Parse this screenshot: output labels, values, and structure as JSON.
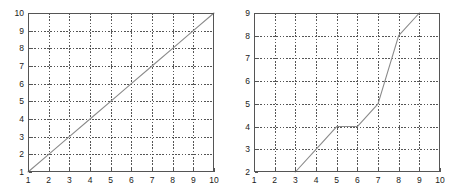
{
  "figure": {
    "background_color": "#ffffff",
    "axes_color": "#555555",
    "grid_color": "#555555",
    "line_color": "#8a8a8a",
    "tick_label_color": "#1a1a1a",
    "panel_count": 2
  },
  "chart_data": [
    {
      "type": "line",
      "title": "",
      "xlabel": "",
      "ylabel": "",
      "xlim": [
        1,
        10
      ],
      "ylim": [
        1,
        10
      ],
      "grid": true,
      "grid_style": "dashed",
      "legend": null,
      "xticks": [
        1,
        2,
        3,
        4,
        5,
        6,
        7,
        8,
        9,
        10
      ],
      "yticks": [
        1,
        2,
        3,
        4,
        5,
        6,
        7,
        8,
        9,
        10
      ],
      "xticklabels": [
        "1",
        "2",
        "3",
        "4",
        "5",
        "6",
        "7",
        "8",
        "9",
        "10"
      ],
      "yticklabels": [
        "1",
        "2",
        "3",
        "4",
        "5",
        "6",
        "7",
        "8",
        "9",
        "10"
      ],
      "series": [
        {
          "name": "",
          "x": [
            1,
            2,
            3,
            4,
            5,
            6,
            7,
            8,
            9,
            10
          ],
          "y": [
            1,
            2,
            3,
            4,
            5,
            6,
            7,
            8,
            9,
            10
          ]
        }
      ]
    },
    {
      "type": "line",
      "title": "",
      "xlabel": "",
      "ylabel": "",
      "xlim": [
        1,
        10
      ],
      "ylim": [
        2,
        9
      ],
      "grid": true,
      "grid_style": "dashed",
      "legend": null,
      "xticks": [
        1,
        2,
        3,
        4,
        5,
        6,
        7,
        8,
        9,
        10
      ],
      "yticks": [
        2,
        3,
        4,
        5,
        6,
        7,
        8,
        9
      ],
      "xticklabels": [
        "1",
        "2",
        "3",
        "4",
        "5",
        "6",
        "7",
        "8",
        "9",
        "10"
      ],
      "yticklabels": [
        "2",
        "3",
        "4",
        "5",
        "6",
        "7",
        "8",
        "9"
      ],
      "series": [
        {
          "name": "",
          "x": [
            3,
            4,
            5,
            6,
            7,
            8,
            9
          ],
          "y": [
            2,
            3,
            4,
            4,
            5,
            8,
            9
          ]
        }
      ]
    }
  ]
}
